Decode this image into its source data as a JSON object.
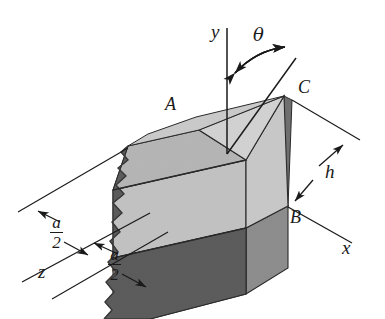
{
  "figure": {
    "background_color": "#ffffff",
    "line_color": "#1a1a1a",
    "axes": [
      {
        "name": "y-axis",
        "label": "y"
      },
      {
        "name": "x-axis",
        "label": "x"
      },
      {
        "name": "z-axis",
        "label": "z"
      }
    ],
    "angle": {
      "name": "theta-angle",
      "label": "θ"
    },
    "points": [
      {
        "name": "point-a",
        "label": "A"
      },
      {
        "name": "point-b",
        "label": "B"
      },
      {
        "name": "point-c",
        "label": "C"
      }
    ],
    "dimensions": [
      {
        "name": "dim-a-over-2-upper",
        "numerator": "a",
        "denominator": "2"
      },
      {
        "name": "dim-a-over-2-lower",
        "numerator": "a",
        "denominator": "2"
      },
      {
        "name": "dim-h",
        "label": "h"
      }
    ],
    "surfaces": {
      "top_left_face_color": "#b9b9b9",
      "top_right_face_color": "#cfcfcf",
      "front_face_color": "#a0a0a0",
      "right_face_color": "#8a8a8a",
      "cut_strip_color": "#6e6e6e",
      "broken_edge_color": "#5a5a5a"
    }
  }
}
